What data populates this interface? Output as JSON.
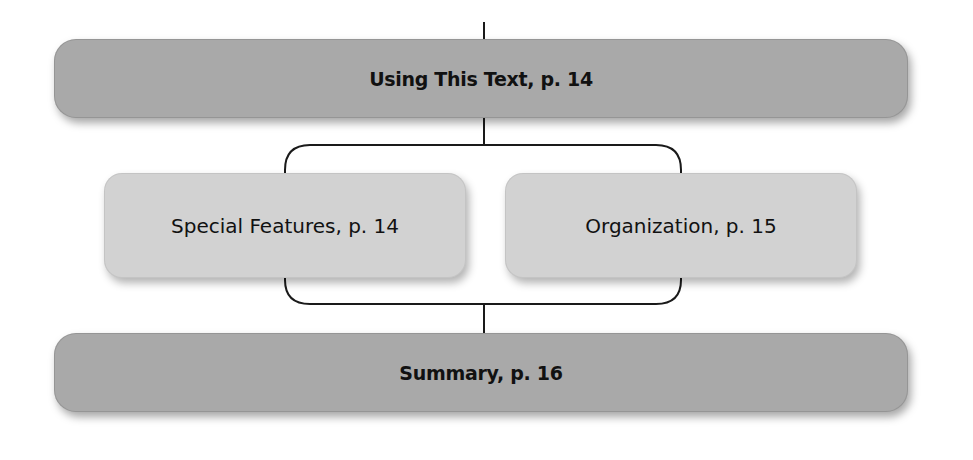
{
  "diagram": {
    "top": {
      "label": "Using This Text, p. 14"
    },
    "children": [
      {
        "label": "Special Features, p. 14"
      },
      {
        "label": "Organization, p. 15"
      }
    ],
    "bottom": {
      "label": "Summary, p. 16"
    }
  },
  "colors": {
    "primary_box": "#a9a9a9",
    "secondary_box": "#d2d2d2",
    "connector": "#1a1a1a",
    "text": "#111111"
  }
}
